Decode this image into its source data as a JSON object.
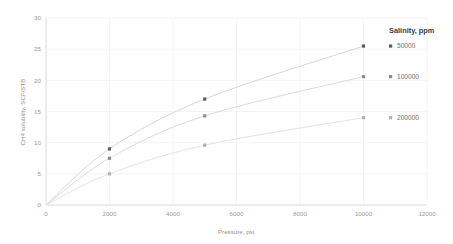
{
  "chart_data": {
    "type": "scatter",
    "title": "",
    "xlabel": "Pressure, psi",
    "ylabel": "CH4 solubility, SCF/STB",
    "xlim": [
      0,
      12000
    ],
    "ylim": [
      0,
      30
    ],
    "xticks": [
      "0",
      "2000",
      "4000",
      "6000",
      "8000",
      "10000",
      "12000"
    ],
    "yticks": [
      "0",
      "5",
      "10",
      "15",
      "20",
      "25",
      "30"
    ],
    "grid": true,
    "legend_position": "right",
    "legend_title": "Salinity, ppm",
    "x": [
      2000,
      5000,
      10000
    ],
    "series": [
      {
        "name": "50000",
        "color": "#5a5a5a",
        "values": [
          9.0,
          17.0,
          25.5
        ],
        "trend_color": "#d9d2e0"
      },
      {
        "name": "100000",
        "color": "#8c8c8c",
        "values": [
          7.5,
          14.3,
          20.6
        ],
        "trend_color": "#ded7e4"
      },
      {
        "name": "200000",
        "color": "#b0b0b0",
        "values": [
          5.0,
          9.6,
          14.0
        ],
        "trend_color": "#e6e1ea"
      }
    ]
  },
  "axes": {
    "x_title": "Pressure, psi",
    "y_title": "CH4 solubility, SCF/STB"
  },
  "legend": {
    "title": "Salinity, ppm",
    "entries": [
      {
        "label": "50000"
      },
      {
        "label": "100000"
      },
      {
        "label": "200000"
      }
    ]
  },
  "colors": {
    "axis_line": "#d7d7d7",
    "grid_line": "#f1f1f1",
    "background": "#ffffff"
  }
}
